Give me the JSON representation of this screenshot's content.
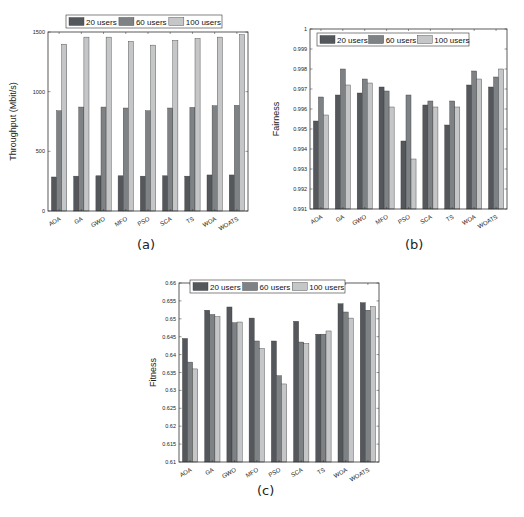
{
  "colors": {
    "s20": "#54585c",
    "s60": "#7e8285",
    "s100": "#c4c6c8",
    "axis": "#333333"
  },
  "captions": {
    "a": "(a)",
    "b": "(b)",
    "c": "(c)"
  },
  "chart_data": [
    {
      "id": "a",
      "type": "bar",
      "title": "",
      "xlabel": "",
      "ylabel": "Throughput (Mbit/s)",
      "ylim": [
        0,
        1500
      ],
      "yticks": [
        0,
        500,
        1000,
        1500
      ],
      "ytick_labels": [
        "0",
        "500",
        "1000",
        "1500"
      ],
      "categories": [
        "AOA",
        "GA",
        "GWO",
        "MFO",
        "PSO",
        "SCA",
        "TS",
        "WOA",
        "WOATS"
      ],
      "series": [
        {
          "name": "20 users",
          "values": [
            285,
            292,
            295,
            295,
            292,
            295,
            292,
            302,
            302
          ]
        },
        {
          "name": "60 users",
          "values": [
            840,
            871,
            871,
            863,
            840,
            863,
            868,
            882,
            885
          ]
        },
        {
          "name": "100 users",
          "values": [
            1398,
            1457,
            1457,
            1421,
            1390,
            1429,
            1446,
            1457,
            1477
          ]
        }
      ],
      "legend_position": "top-center",
      "grid": false
    },
    {
      "id": "b",
      "type": "bar",
      "title": "",
      "xlabel": "",
      "ylabel": "Fairness",
      "ylim": [
        0.991,
        1
      ],
      "yticks": [
        0.991,
        0.992,
        0.993,
        0.994,
        0.995,
        0.996,
        0.997,
        0.998,
        0.999,
        1
      ],
      "ytick_labels": [
        "0.991",
        "0.992",
        "0.993",
        "0.994",
        "0.995",
        "0.996",
        "0.997",
        "0.998",
        "0.999",
        "1"
      ],
      "categories": [
        "AOA",
        "GA",
        "GWO",
        "MFO",
        "PSO",
        "SCA",
        "TS",
        "WOA",
        "WOATS"
      ],
      "series": [
        {
          "name": "20 users",
          "values": [
            0.9954,
            0.9967,
            0.9968,
            0.9971,
            0.9944,
            0.9962,
            0.9952,
            0.9972,
            0.9971
          ]
        },
        {
          "name": "60 users",
          "values": [
            0.9966,
            0.998,
            0.9975,
            0.9969,
            0.9967,
            0.9964,
            0.9964,
            0.9979,
            0.9976
          ]
        },
        {
          "name": "100 users",
          "values": [
            0.9957,
            0.9972,
            0.9973,
            0.9961,
            0.9935,
            0.9961,
            0.9961,
            0.9975,
            0.998
          ]
        }
      ],
      "legend_position": "top-left",
      "grid": false
    },
    {
      "id": "c",
      "type": "bar",
      "title": "",
      "xlabel": "",
      "ylabel": "Fitness",
      "ylim": [
        0.61,
        0.66
      ],
      "yticks": [
        0.61,
        0.615,
        0.62,
        0.625,
        0.63,
        0.635,
        0.64,
        0.645,
        0.65,
        0.655,
        0.66
      ],
      "ytick_labels": [
        "0.61",
        "0.615",
        "0.62",
        "0.625",
        "0.63",
        "0.635",
        "0.64",
        "0.645",
        "0.65",
        "0.655",
        "0.66"
      ],
      "categories": [
        "AOA",
        "GA",
        "GWO",
        "MFO",
        "PSO",
        "SCA",
        "TS",
        "WOA",
        "WOATS"
      ],
      "series": [
        {
          "name": "20 users",
          "values": [
            0.6445,
            0.6524,
            0.6533,
            0.6502,
            0.6438,
            0.6493,
            0.6457,
            0.6542,
            0.6545
          ]
        },
        {
          "name": "60 users",
          "values": [
            0.6379,
            0.6512,
            0.6489,
            0.6438,
            0.6341,
            0.6435,
            0.6457,
            0.6519,
            0.6524
          ]
        },
        {
          "name": "100 users",
          "values": [
            0.636,
            0.6506,
            0.6491,
            0.6417,
            0.6318,
            0.6431,
            0.6466,
            0.6502,
            0.6534
          ]
        }
      ],
      "legend_position": "top-center",
      "grid": false
    }
  ]
}
